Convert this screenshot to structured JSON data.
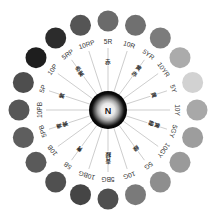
{
  "diagram": {
    "center": {
      "label": "N",
      "cx": 108,
      "cy": 110
    },
    "layout": {
      "swatch_radius": 89,
      "swatch_size": 10.5,
      "label_radius": 69,
      "cn_radius": 48,
      "line_inner": 19,
      "line_outer": 62
    },
    "hues": [
      {
        "code": "5R",
        "angle": -90,
        "gray": "#6b6b6b",
        "cn": "赤"
      },
      {
        "code": "10R",
        "angle": -72,
        "gray": "#707070",
        "cn": ""
      },
      {
        "code": "5YR",
        "angle": -54,
        "gray": "#7c7c7c",
        "cn": "黄赤"
      },
      {
        "code": "10YR",
        "angle": -36,
        "gray": "#ababab",
        "cn": ""
      },
      {
        "code": "5Y",
        "angle": -18,
        "gray": "#d2d2d2",
        "cn": "黄"
      },
      {
        "code": "10Y",
        "angle": 0,
        "gray": "#a8a8a8",
        "cn": ""
      },
      {
        "code": "5GY",
        "angle": 18,
        "gray": "#9d9d9d",
        "cn": "黄緑"
      },
      {
        "code": "10GY",
        "angle": 36,
        "gray": "#9a9a9a",
        "cn": ""
      },
      {
        "code": "5G",
        "angle": 54,
        "gray": "#8e8e8e",
        "cn": "緑"
      },
      {
        "code": "10G",
        "angle": 72,
        "gray": "#7a7a7a",
        "cn": ""
      },
      {
        "code": "5BG",
        "angle": 90,
        "gray": "#4f4f4f",
        "cn": "青緑"
      },
      {
        "code": "10BG",
        "angle": 108,
        "gray": "#454545",
        "cn": ""
      },
      {
        "code": "5B",
        "angle": 126,
        "gray": "#505050",
        "cn": "青"
      },
      {
        "code": "10B",
        "angle": 144,
        "gray": "#5a5a5a",
        "cn": ""
      },
      {
        "code": "5PB",
        "angle": 162,
        "gray": "#5e5e5e",
        "cn": "青紫"
      },
      {
        "code": "10PB",
        "angle": 180,
        "gray": "#575757",
        "cn": ""
      },
      {
        "code": "5P",
        "angle": 198,
        "gray": "#4e4e4e",
        "cn": "紫"
      },
      {
        "code": "10P",
        "angle": 216,
        "gray": "#1e1e1e",
        "cn": ""
      },
      {
        "code": "5RP",
        "angle": 234,
        "gray": "#2c2c2c",
        "cn": "赤紫"
      },
      {
        "code": "10RP",
        "angle": 252,
        "gray": "#555555",
        "cn": ""
      }
    ],
    "colors": {
      "line": "#b8b8b8",
      "text": "#333333",
      "hub_outer": "#000000"
    }
  }
}
